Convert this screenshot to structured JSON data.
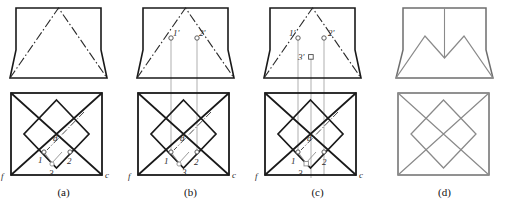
{
  "figure": {
    "panels": [
      {
        "id": "a",
        "caption": "(a)",
        "description": "Given front view (trapezoid with dash-dot triangle) and top view (square with diagonals and inscribed diamond)",
        "labels": {
          "point1": "1",
          "point2": "2",
          "point3": "3",
          "pointd": "d",
          "cornerf": "f",
          "cornerc": "c"
        }
      },
      {
        "id": "b",
        "caption": "(b)",
        "description": "Points 1 and 2 projected up from top view to front view with vertical projectors",
        "labels": {
          "point1prime": "1'",
          "point2prime": "2'",
          "point1": "1",
          "point2": "2",
          "point3": "3",
          "pointd": "d",
          "cornerf": "f",
          "cornerc": "c"
        }
      },
      {
        "id": "c",
        "caption": "(c)",
        "description": "Point 3 additionally projected up; all three points located in the front view",
        "labels": {
          "point1prime": "1'",
          "point2prime": "2'",
          "point3prime": "3'",
          "point1": "1",
          "point2": "2",
          "point3": "3",
          "pointd": "d",
          "cornerf": "f",
          "cornerc": "c"
        }
      },
      {
        "id": "d",
        "caption": "(d)",
        "description": "Completed views: front view shows double-peak (M) profile, top view shows square with diamond and diagonals"
      }
    ],
    "colors": {
      "outline": "#1a1a1a",
      "construction": "#9a9a9a",
      "result": "#8a8a8a",
      "label": "#2a2a2a",
      "background": "#ffffff"
    },
    "line_styles": {
      "object": "solid-heavy",
      "center": "dash-dot",
      "projector": "thin-gray-solid",
      "hidden": "dash-dot-thin"
    }
  }
}
